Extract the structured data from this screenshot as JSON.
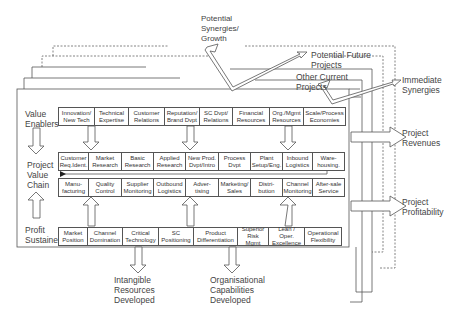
{
  "diagram": {
    "layers": {
      "potential_future_projects": "Potential Future\nProjects",
      "other_current_projects": "Other Current\nProjects"
    },
    "top_arrow_label": "Potential\nSynergies/\nGrowth",
    "right_outputs": {
      "immediate_synergies": "Immediate\nSynergies",
      "project_revenues": "Project\nRevenues",
      "project_profitability": "Project\nProfitability"
    },
    "bottom_outputs": {
      "intangible": "Intangible\nResources\nDeveloped",
      "organisational": "Organisational\nCapabilities\nDeveloped"
    },
    "left_labels": {
      "value_enablers": "Value\nEnablers",
      "project_value_chain": "Project\nValue\nChain",
      "profit_sustainers": "Profit\nSustainers"
    },
    "value_enablers": [
      "Innovation/\nNew Tech",
      "Technical\nExpertise",
      "Customer\nRelations",
      "Reputation/\nBrand Dvpt",
      "SC Dvpt/\nRelations",
      "Financial\nResources",
      "Org./Mgmt\nResources",
      "Scale/Process\nEconomies"
    ],
    "value_chain_row1": [
      "Customer\nReq.Ident.",
      "Market\nResearch",
      "Basic\nResearch",
      "Applied\nResearch",
      "New Prod.\nDvpt/Intro",
      "Process\nDvpt",
      "Plant\nSetup/Eng.",
      "Inbound\nLogistics",
      "Ware-\nhousing."
    ],
    "value_chain_row2": [
      "Manu-\nfacturing",
      "Quality\nControl",
      "Supplier\nMonitoring",
      "Outbound\nLogistics",
      "Adver-\ntising",
      "Marketing/\nSales",
      "Distri-\nbution",
      "Channel\nMonitoring",
      "After-sale\nService"
    ],
    "profit_sustainers": [
      "Market\nPosition",
      "Channel\nDomination",
      "Critical\nTechnology",
      "SC\nPositioning",
      "Product\nDifferentiation",
      "Superior\nRisk Mgmt",
      "Lean / Oper.\nExcellence",
      "Operational\nFlexibility"
    ]
  }
}
